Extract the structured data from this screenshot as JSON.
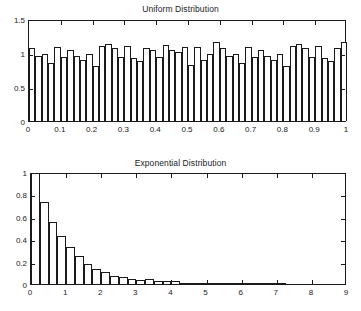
{
  "figure": {
    "background": "#ffffff",
    "line_color": "#1a1a1a"
  },
  "chart_data": [
    {
      "type": "bar",
      "name": "uniform-histogram",
      "title": "Uniform Distribution",
      "xlabel": "",
      "ylabel": "",
      "xlim": [
        0,
        1
      ],
      "ylim": [
        0,
        1.5
      ],
      "xticks": [
        0,
        0.1,
        0.2,
        0.3,
        0.4,
        0.5,
        0.6,
        0.7,
        0.8,
        0.9,
        1
      ],
      "xticklabels": [
        "0",
        "0.1",
        "0.2",
        "0.3",
        "0.4",
        "0.5",
        "0.6",
        "0.7",
        "0.8",
        "0.9",
        "1"
      ],
      "yticks": [
        0,
        0.5,
        1,
        1.5
      ],
      "yticklabels": [
        "0",
        "0.5",
        "1",
        "1.5"
      ],
      "grid": false,
      "legend": null,
      "bar_fill": "#ffffff",
      "bar_edge": "#1a1a1a",
      "bin_width": 0.02,
      "x": [
        0.01,
        0.03,
        0.05,
        0.07,
        0.09,
        0.11,
        0.13,
        0.15,
        0.17,
        0.19,
        0.21,
        0.23,
        0.25,
        0.27,
        0.29,
        0.31,
        0.33,
        0.35,
        0.37,
        0.39,
        0.41,
        0.43,
        0.45,
        0.47,
        0.49,
        0.51,
        0.53,
        0.55,
        0.57,
        0.59,
        0.61,
        0.63,
        0.65,
        0.67,
        0.69,
        0.71,
        0.73,
        0.75,
        0.77,
        0.79,
        0.81,
        0.83,
        0.85,
        0.87,
        0.89,
        0.91,
        0.93,
        0.95,
        0.97,
        0.99
      ],
      "values": [
        1.08,
        0.95,
        0.98,
        0.85,
        1.09,
        0.94,
        1.05,
        0.95,
        0.89,
        0.99,
        0.81,
        1.11,
        1.13,
        1.07,
        0.94,
        1.1,
        0.92,
        0.88,
        1.07,
        1.05,
        0.94,
        1.12,
        1.05,
        1.02,
        1.09,
        0.83,
        1.09,
        0.89,
        0.98,
        1.16,
        1.08,
        0.95,
        0.98,
        0.85,
        1.09,
        0.94,
        1.05,
        0.95,
        0.89,
        0.99,
        0.81,
        1.11,
        1.13,
        1.07,
        0.94,
        1.1,
        0.92,
        0.88,
        1.07,
        1.16
      ]
    },
    {
      "type": "bar",
      "name": "exponential-histogram",
      "title": "Exponential Distribution",
      "xlabel": "",
      "ylabel": "",
      "xlim": [
        0,
        9
      ],
      "ylim": [
        0,
        1
      ],
      "xticks": [
        0,
        1,
        2,
        3,
        4,
        5,
        6,
        7,
        8,
        9
      ],
      "xticklabels": [
        "0",
        "1",
        "2",
        "3",
        "4",
        "5",
        "6",
        "7",
        "8",
        "9"
      ],
      "yticks": [
        0,
        0.2,
        0.4,
        0.6,
        0.8,
        1
      ],
      "yticklabels": [
        "0",
        "0.2",
        "0.4",
        "0.6",
        "0.8",
        "1"
      ],
      "grid": false,
      "legend": null,
      "bar_fill": "#ffffff",
      "bar_edge": "#1a1a1a",
      "bin_width": 0.25,
      "x": [
        0.125,
        0.375,
        0.625,
        0.875,
        1.125,
        1.375,
        1.625,
        1.875,
        2.125,
        2.375,
        2.625,
        2.875,
        3.125,
        3.375,
        3.625,
        3.875,
        4.125,
        4.375,
        4.625,
        4.875,
        5.125,
        5.375,
        5.625,
        5.875,
        6.125,
        6.375,
        6.625,
        6.875,
        7.125
      ],
      "values": [
        0.99,
        0.735,
        0.55,
        0.43,
        0.33,
        0.252,
        0.176,
        0.137,
        0.108,
        0.075,
        0.067,
        0.042,
        0.032,
        0.043,
        0.026,
        0.024,
        0.027,
        0.012,
        0.009,
        0.008,
        0.006,
        0.008,
        0.011,
        0.004,
        0.003,
        0.002,
        0.002,
        0.001,
        0.001
      ]
    }
  ]
}
